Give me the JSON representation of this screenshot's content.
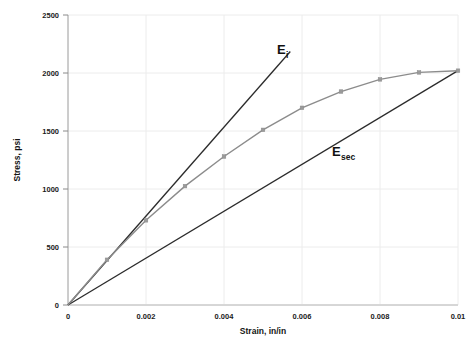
{
  "chart_data": {
    "type": "line",
    "title": "",
    "xlabel": "Strain, in/in",
    "ylabel": "Stress, psi",
    "xlim": [
      0,
      0.01
    ],
    "ylim": [
      0,
      2500
    ],
    "grid": true,
    "legend": "none",
    "xticks": [
      "0",
      "0.002",
      "0.004",
      "0.006",
      "0.008",
      "0.01"
    ],
    "xtick_values": [
      0,
      0.002,
      0.004,
      0.006,
      0.008,
      0.01
    ],
    "yticks": [
      "0",
      "500",
      "1000",
      "1500",
      "2000",
      "2500"
    ],
    "ytick_values": [
      0,
      500,
      1000,
      1500,
      2000,
      2500
    ],
    "series": [
      {
        "name": "stress-strain-curve",
        "color": "#8c8c8c",
        "markers": true,
        "x": [
          0,
          0.001,
          0.002,
          0.003,
          0.004,
          0.005,
          0.006,
          0.007,
          0.008,
          0.009,
          0.01
        ],
        "values": [
          0,
          390,
          730,
          1025,
          1280,
          1510,
          1700,
          1840,
          1945,
          2005,
          2020
        ]
      },
      {
        "name": "initial-tangent-modulus-line",
        "color": "#2b2b2b",
        "markers": false,
        "x": [
          0,
          0.0057
        ],
        "values": [
          0,
          2185
        ]
      },
      {
        "name": "secant-modulus-line",
        "color": "#2b2b2b",
        "markers": false,
        "x": [
          0,
          0.01
        ],
        "values": [
          0,
          2020
        ]
      }
    ],
    "annotations": [
      {
        "name": "Ei-label",
        "base": "E",
        "sub": "i",
        "x": 0.00605,
        "y": 2185
      },
      {
        "name": "Esec-label",
        "base": "E",
        "sub": "sec",
        "x": 0.00765,
        "y": 1455
      }
    ]
  },
  "colors": {
    "grid": "#ececec",
    "axis": "#b0b0b0",
    "curve": "#8c8c8c",
    "line": "#2b2b2b",
    "text": "#141414",
    "background": "#ffffff"
  }
}
